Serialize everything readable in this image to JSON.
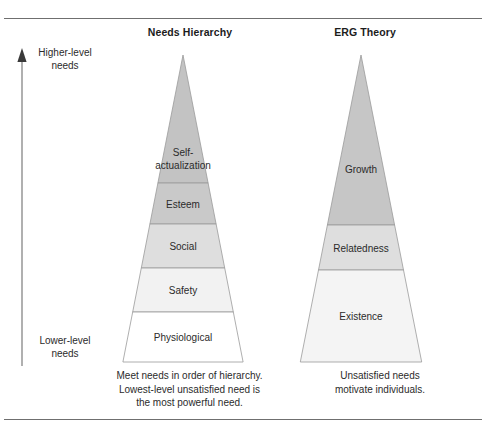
{
  "figure": {
    "axis": {
      "top_label": "Higher-level\nneeds",
      "top_label_line1": "Higher-level",
      "top_label_line2": "needs",
      "bottom_label_line1": "Lower-level",
      "bottom_label_line2": "needs",
      "arrow_direction": "up"
    },
    "columns": [
      {
        "id": "needs-hierarchy",
        "title": "Needs Hierarchy",
        "caption_lines": [
          "Meet needs in order of hierarchy.",
          "Lowest-level unsatisfied need is",
          "the most powerful need."
        ],
        "tiers": [
          {
            "label": "Self-",
            "label2": "actualization",
            "color": "#c3c3c3"
          },
          {
            "label": "Esteem",
            "label2": "",
            "color": "#c9c9c9"
          },
          {
            "label": "Social",
            "label2": "",
            "color": "#dedede"
          },
          {
            "label": "Safety",
            "label2": "",
            "color": "#f2f2f2"
          },
          {
            "label": "Physiological",
            "label2": "",
            "color": "#ffffff"
          }
        ]
      },
      {
        "id": "erg-theory",
        "title": "ERG Theory",
        "caption_lines": [
          "Unsatisfied needs",
          "motivate individuals."
        ],
        "tiers": [
          {
            "label": "Growth",
            "label2": "",
            "color": "#c6c6c6"
          },
          {
            "label": "Relatedness",
            "label2": "",
            "color": "#dedede"
          },
          {
            "label": "Existence",
            "label2": "",
            "color": "#f4f4f4"
          }
        ]
      }
    ],
    "colors": {
      "rule": "#6f6f6f",
      "outline": "#8a8a8a",
      "text": "#2b2b2b",
      "background": "#ffffff"
    }
  }
}
